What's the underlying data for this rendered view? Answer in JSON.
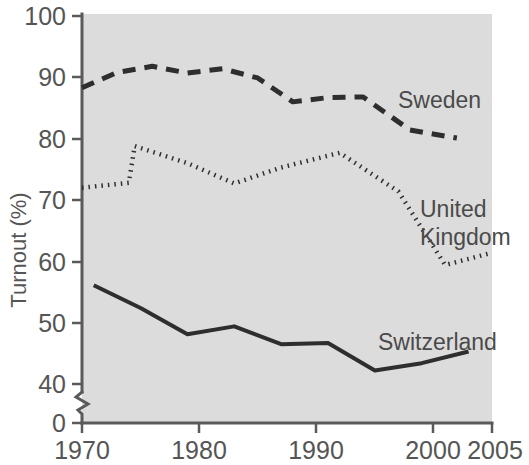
{
  "chart_data": {
    "type": "line",
    "title": "",
    "xlabel": "",
    "ylabel": "Turnout (%)",
    "xlim": [
      1970,
      2005
    ],
    "ylim": [
      40,
      100
    ],
    "y_axis_break": true,
    "y_zero_tick": "0",
    "grid": false,
    "legend_position": "inline-right",
    "xticks": [
      "1970",
      "1980",
      "1990",
      "2000",
      "2005"
    ],
    "xtick_values": [
      1970,
      1980,
      1990,
      2000,
      2005
    ],
    "yticks": [
      "0",
      "40",
      "50",
      "60",
      "70",
      "80",
      "90",
      "100"
    ],
    "ytick_values": [
      0,
      40,
      50,
      60,
      70,
      80,
      90,
      100
    ],
    "background_color": "#dcdcdc",
    "line_color": "#2e2e2e",
    "series": [
      {
        "name": "Sweden",
        "style": "dashed",
        "label": "Sweden",
        "x": [
          1970,
          1973,
          1976,
          1979,
          1982,
          1985,
          1988,
          1991,
          1994,
          1998,
          2002
        ],
        "values": [
          88.3,
          90.8,
          91.8,
          90.7,
          91.4,
          89.9,
          86.0,
          86.7,
          86.8,
          81.4,
          80.1
        ]
      },
      {
        "name": "United Kingdom",
        "style": "dotted",
        "label": "United Kingdom",
        "label_line1": "United",
        "label_line2": "Kingdom",
        "x": [
          1970,
          1974,
          1974.5,
          1979,
          1983,
          1987,
          1992,
          1997,
          2001,
          2005
        ],
        "values": [
          72.0,
          72.8,
          78.8,
          76.0,
          72.7,
          75.3,
          77.7,
          71.4,
          59.4,
          61.4
        ]
      },
      {
        "name": "Switzerland",
        "style": "solid",
        "label": "Switzerland",
        "x": [
          1971,
          1975,
          1979,
          1983,
          1987,
          1991,
          1995,
          1999,
          2003
        ],
        "values": [
          56.1,
          52.4,
          48.1,
          49.4,
          46.5,
          46.7,
          42.2,
          43.4,
          45.3
        ]
      }
    ]
  },
  "labels": {
    "sweden": "Sweden",
    "uk_line1": "United",
    "uk_line2": "Kingdom",
    "switzerland": "Switzerland",
    "ylabel": "Turnout (%)",
    "y_100": "100",
    "y_90": "90",
    "y_80": "80",
    "y_70": "70",
    "y_60": "60",
    "y_50": "50",
    "y_40": "40",
    "y_0": "0",
    "x_1970": "1970",
    "x_1980": "1980",
    "x_1990": "1990",
    "x_2000": "2000",
    "x_2005": "2005"
  }
}
